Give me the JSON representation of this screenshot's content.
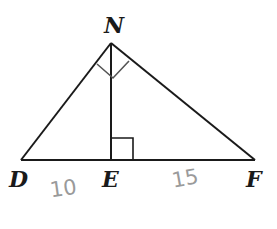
{
  "diagram": {
    "type": "geometry-triangle",
    "colors": {
      "line": "#1a1a1a",
      "right_angle_mark": "#555555",
      "handwriting": "#9a9a9a"
    },
    "vertices": {
      "N": {
        "label": "N",
        "x": 111,
        "y": 43
      },
      "D": {
        "label": "D",
        "x": 21,
        "y": 160
      },
      "E": {
        "label": "E",
        "x": 111,
        "y": 160
      },
      "F": {
        "label": "F",
        "x": 255,
        "y": 160
      }
    },
    "segments": [
      "DN",
      "NF",
      "DF",
      "NE"
    ],
    "right_angles": [
      "DNF",
      "NED"
    ],
    "annotations": [
      {
        "text": "10",
        "segment": "DE",
        "style": "handwritten"
      },
      {
        "text": "15",
        "segment": "EF",
        "style": "handwritten"
      }
    ]
  }
}
